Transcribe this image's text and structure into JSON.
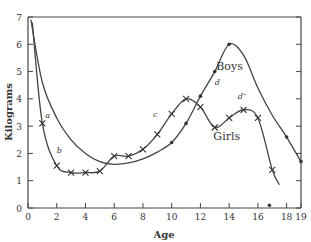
{
  "chart_data": {
    "type": "line",
    "title": "",
    "xlabel": "Age",
    "ylabel": "Kilograms",
    "xlim": [
      0,
      19
    ],
    "ylim": [
      0,
      7
    ],
    "grid": false,
    "x_ticks": [
      "0",
      "2",
      "4",
      "6",
      "8",
      "10",
      "12",
      "14",
      "16",
      "18",
      "19"
    ],
    "y_ticks": [
      "0",
      "1",
      "2",
      "3",
      "4",
      "5",
      "6",
      "7"
    ],
    "series": [
      {
        "name": "Boys",
        "marker": "dot",
        "points": [
          [
            0.2,
            6.9
          ],
          [
            1,
            4.6
          ],
          [
            2,
            3.3
          ],
          [
            3,
            2.5
          ],
          [
            4,
            2.0
          ],
          [
            5,
            1.7
          ],
          [
            6,
            1.6
          ],
          [
            7,
            1.65
          ],
          [
            8,
            1.8
          ],
          [
            9,
            2.05
          ],
          [
            10,
            2.4
          ],
          [
            11,
            3.1
          ],
          [
            12,
            4.1
          ],
          [
            13,
            5.0
          ],
          [
            14,
            6.0
          ],
          [
            15,
            5.6
          ],
          [
            16,
            4.4
          ],
          [
            17,
            3.4
          ],
          [
            18,
            2.6
          ],
          [
            19,
            1.7
          ]
        ],
        "markers_at": [
          [
            10,
            2.4
          ],
          [
            11,
            3.1
          ],
          [
            12,
            4.1
          ],
          [
            13,
            5.0
          ],
          [
            14,
            6.0
          ],
          [
            18,
            2.6
          ],
          [
            19,
            1.7
          ],
          [
            16.8,
            0.1
          ]
        ]
      },
      {
        "name": "Girls",
        "marker": "x",
        "points": [
          [
            0.3,
            6.8
          ],
          [
            1,
            3.1
          ],
          [
            2,
            1.55
          ],
          [
            3,
            1.3
          ],
          [
            4,
            1.3
          ],
          [
            5,
            1.35
          ],
          [
            6,
            1.9
          ],
          [
            7,
            1.9
          ],
          [
            8,
            2.15
          ],
          [
            9,
            2.7
          ],
          [
            10,
            3.45
          ],
          [
            11,
            4.0
          ],
          [
            12,
            3.7
          ],
          [
            13,
            2.95
          ],
          [
            14,
            3.3
          ],
          [
            15,
            3.6
          ],
          [
            16,
            3.3
          ],
          [
            17,
            1.4
          ],
          [
            17.5,
            0.85
          ]
        ],
        "markers_at": [
          [
            1,
            3.1
          ],
          [
            2,
            1.55
          ],
          [
            3,
            1.3
          ],
          [
            4,
            1.3
          ],
          [
            5,
            1.35
          ],
          [
            6,
            1.9
          ],
          [
            7,
            1.9
          ],
          [
            8,
            2.15
          ],
          [
            9,
            2.7
          ],
          [
            10,
            3.45
          ],
          [
            11,
            4.0
          ],
          [
            12,
            3.7
          ],
          [
            13,
            2.95
          ],
          [
            14,
            3.3
          ],
          [
            15,
            3.6
          ],
          [
            16,
            3.3
          ],
          [
            17,
            1.4
          ]
        ]
      }
    ],
    "annotations": [
      {
        "text": "a",
        "x": 1.2,
        "y": 3.3
      },
      {
        "text": "b",
        "x": 2.0,
        "y": 2.0
      },
      {
        "text": "c",
        "x": 8.7,
        "y": 3.35
      },
      {
        "text": "d",
        "x": 13.0,
        "y": 4.5
      },
      {
        "text": "d″",
        "x": 14.6,
        "y": 4.0
      },
      {
        "text": "Boys",
        "x": 13.1,
        "y": 5.05
      },
      {
        "text": "Girls",
        "x": 12.9,
        "y": 2.5
      }
    ]
  }
}
